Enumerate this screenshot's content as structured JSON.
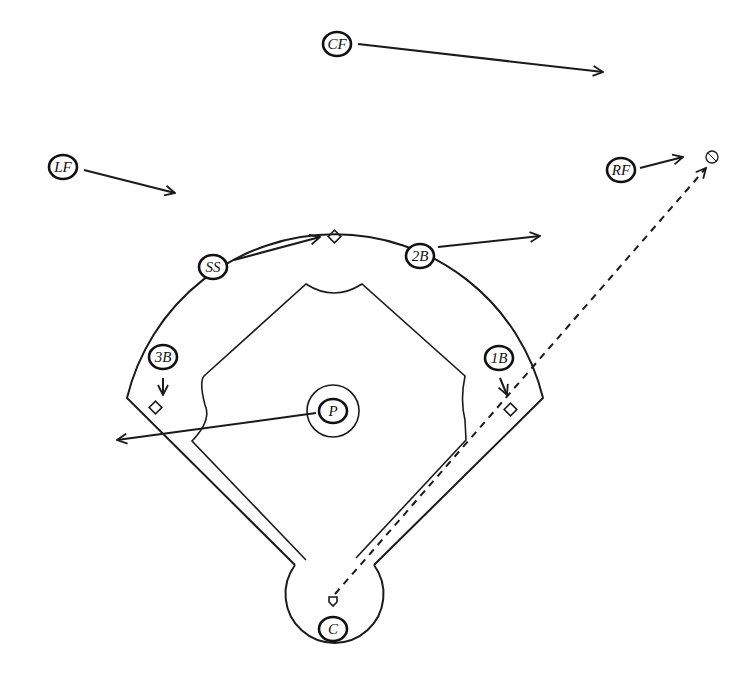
{
  "diagram": {
    "type": "baseball-field-defensive-positions",
    "colors": {
      "ink": "#1a1a1a",
      "background": "#ffffff"
    },
    "positions": [
      {
        "id": "CF",
        "label": "CF",
        "x": 337,
        "y": 44
      },
      {
        "id": "LF",
        "label": "LF",
        "x": 63,
        "y": 167
      },
      {
        "id": "RF",
        "label": "RF",
        "x": 621,
        "y": 167
      },
      {
        "id": "SS",
        "label": "SS",
        "x": 213,
        "y": 267
      },
      {
        "id": "2B",
        "label": "2B",
        "x": 420,
        "y": 257
      },
      {
        "id": "3B",
        "label": "3B",
        "x": 163,
        "y": 357
      },
      {
        "id": "1B",
        "label": "1B",
        "x": 499,
        "y": 357
      },
      {
        "id": "P",
        "label": "P",
        "x": 333,
        "y": 411
      },
      {
        "id": "C",
        "label": "C",
        "x": 333,
        "y": 628
      }
    ],
    "movement_arrows": [
      {
        "from": "CF",
        "to_x": 603,
        "to_y": 72
      },
      {
        "from": "LF",
        "to_x": 175,
        "to_y": 193
      },
      {
        "from": "RF",
        "to_x": 683,
        "to_y": 157
      },
      {
        "from": "SS",
        "to_x": 320,
        "to_y": 237
      },
      {
        "from": "2B",
        "to_x": 540,
        "to_y": 236
      },
      {
        "from": "3B",
        "to_x": 163,
        "to_y": 395
      },
      {
        "from": "1B",
        "to_x": 507,
        "to_y": 395
      },
      {
        "from": "P",
        "to_x": 117,
        "to_y": 440
      }
    ],
    "ball_path": {
      "from": "home-plate",
      "to": "ball",
      "style": "dashed"
    },
    "ball": {
      "x": 712,
      "y": 157
    }
  }
}
